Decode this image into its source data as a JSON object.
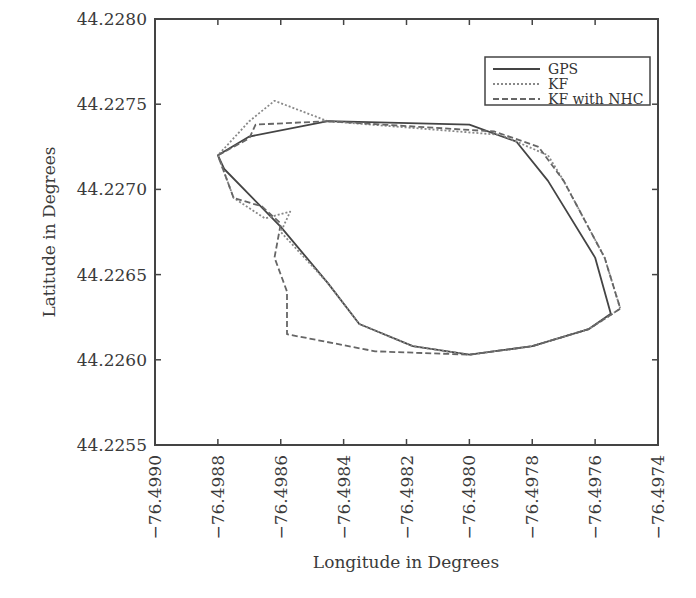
{
  "chart_data": {
    "type": "line",
    "title": "",
    "xlabel": "Longitude in Degrees",
    "ylabel": "Latitude in Degrees",
    "xlim": [
      -76.499,
      -76.4974
    ],
    "ylim": [
      44.2255,
      44.228
    ],
    "x_ticks": [
      "-76.4990",
      "-76.4988",
      "-76.4986",
      "-76.4984",
      "-76.4982",
      "-76.4980",
      "-76.4978",
      "-76.4976",
      "-76.4974"
    ],
    "y_ticks": [
      "44.2280",
      "44.2275",
      "44.2270",
      "44.2265",
      "44.2260",
      "44.2255"
    ],
    "grid": false,
    "legend_position": "upper right",
    "data_provenance": "traced_approximate",
    "data_note": "The screenshot has no data table or point labels. The series coordinates below are approximations traced by eye from the pixel positions of each curve, converted via the axis tick mapping. They are a visual reconstruction, not the original GPS/KF values.",
    "series": [
      {
        "name": "GPS",
        "style": "solid",
        "color": "#444444",
        "provenance": "traced_approximate",
        "points": [
          [
            -76.49845,
            44.2274
          ],
          [
            -76.4987,
            44.22731
          ],
          [
            -76.4988,
            44.2272
          ],
          [
            -76.49878,
            44.22712
          ],
          [
            -76.4986,
            44.22678
          ],
          [
            -76.49845,
            44.22645
          ],
          [
            -76.49835,
            44.22621
          ],
          [
            -76.49818,
            44.22608
          ],
          [
            -76.498,
            44.22603
          ],
          [
            -76.4978,
            44.22608
          ],
          [
            -76.49762,
            44.22618
          ],
          [
            -76.49755,
            44.22627
          ],
          [
            -76.4976,
            44.2266
          ],
          [
            -76.49775,
            44.22705
          ],
          [
            -76.49785,
            44.22728
          ],
          [
            -76.498,
            44.22738
          ],
          [
            -76.49845,
            44.2274
          ]
        ]
      },
      {
        "name": "KF",
        "style": "dotted",
        "color": "#888888",
        "provenance": "traced_approximate",
        "points": [
          [
            -76.49845,
            44.2274
          ],
          [
            -76.49862,
            44.22752
          ],
          [
            -76.4987,
            44.2274
          ],
          [
            -76.4988,
            44.2272
          ],
          [
            -76.49875,
            44.22695
          ],
          [
            -76.49865,
            44.22683
          ],
          [
            -76.49857,
            44.22687
          ],
          [
            -76.4986,
            44.22675
          ],
          [
            -76.49845,
            44.22645
          ],
          [
            -76.49835,
            44.22621
          ],
          [
            -76.49818,
            44.22608
          ],
          [
            -76.498,
            44.22603
          ],
          [
            -76.4978,
            44.22608
          ],
          [
            -76.49762,
            44.22618
          ],
          [
            -76.49752,
            44.2263
          ],
          [
            -76.49757,
            44.2266
          ],
          [
            -76.4977,
            44.22705
          ],
          [
            -76.49775,
            44.2272
          ],
          [
            -76.4979,
            44.22732
          ],
          [
            -76.49845,
            44.2274
          ]
        ]
      },
      {
        "name": "KF with NHC",
        "style": "dashed",
        "color": "#666666",
        "provenance": "traced_approximate",
        "points": [
          [
            -76.49845,
            44.2274
          ],
          [
            -76.49868,
            44.22738
          ],
          [
            -76.4987,
            44.2273
          ],
          [
            -76.4988,
            44.2272
          ],
          [
            -76.49875,
            44.22695
          ],
          [
            -76.49866,
            44.2269
          ],
          [
            -76.4986,
            44.2268
          ],
          [
            -76.49862,
            44.2266
          ],
          [
            -76.49858,
            44.2264
          ],
          [
            -76.49858,
            44.22615
          ],
          [
            -76.4983,
            44.22605
          ],
          [
            -76.498,
            44.22603
          ],
          [
            -76.4978,
            44.22608
          ],
          [
            -76.49762,
            44.22618
          ],
          [
            -76.49752,
            44.2263
          ],
          [
            -76.49757,
            44.2266
          ],
          [
            -76.4977,
            44.22705
          ],
          [
            -76.49778,
            44.22725
          ],
          [
            -76.49792,
            44.22734
          ],
          [
            -76.49845,
            44.2274
          ]
        ]
      }
    ]
  },
  "legend": {
    "items": [
      {
        "label": "GPS",
        "style": "solid"
      },
      {
        "label": "KF",
        "style": "dotted"
      },
      {
        "label": "KF with NHC",
        "style": "dashed"
      }
    ]
  }
}
